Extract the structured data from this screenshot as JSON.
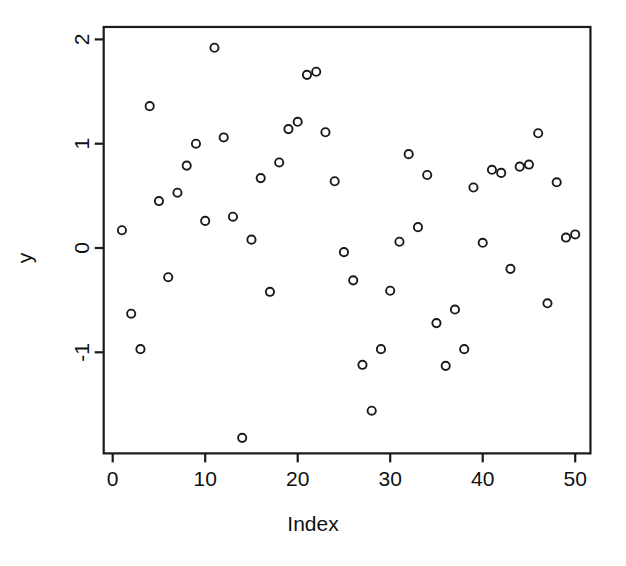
{
  "chart_data": {
    "type": "scatter",
    "title": "",
    "xlabel": "Index",
    "ylabel": "y",
    "xlim": [
      0,
      51
    ],
    "ylim": [
      -1.95,
      2.1
    ],
    "grid": false,
    "legend": null,
    "marker": "open-circle",
    "marker_color": "#1a1a1a",
    "x_ticks": [
      0,
      10,
      20,
      30,
      40,
      50
    ],
    "x_tick_labels": [
      "0",
      "10",
      "20",
      "30",
      "40",
      "50"
    ],
    "y_ticks": [
      -1,
      0,
      1,
      2
    ],
    "y_tick_labels": [
      "-1",
      "0",
      "1",
      "2"
    ],
    "y_tick_label_rotation": 90,
    "n_points": 50,
    "x": [
      1,
      2,
      3,
      4,
      5,
      6,
      7,
      8,
      9,
      10,
      11,
      12,
      13,
      14,
      15,
      16,
      17,
      18,
      19,
      20,
      21,
      22,
      23,
      24,
      25,
      26,
      27,
      28,
      29,
      30,
      31,
      32,
      33,
      34,
      35,
      36,
      37,
      38,
      39,
      40,
      41,
      42,
      43,
      44,
      45,
      46,
      47,
      48,
      49,
      50
    ],
    "y": [
      0.17,
      -0.63,
      -0.97,
      1.36,
      0.45,
      -0.28,
      0.53,
      0.79,
      1.0,
      0.26,
      1.92,
      1.06,
      0.3,
      -1.82,
      0.08,
      0.67,
      -0.42,
      0.82,
      1.14,
      1.21,
      1.66,
      1.69,
      1.11,
      0.64,
      -0.04,
      -0.31,
      -1.12,
      -1.56,
      -0.97,
      -0.41,
      0.06,
      0.9,
      0.2,
      0.7,
      -0.72,
      -1.13,
      -0.59,
      -0.97,
      0.58,
      0.05,
      0.75,
      0.72,
      -0.2,
      0.78,
      0.8,
      1.1,
      -0.53,
      0.63,
      0.1,
      0.13
    ]
  },
  "axes": {
    "x_axis_name": "Index",
    "y_axis_name": "y"
  }
}
